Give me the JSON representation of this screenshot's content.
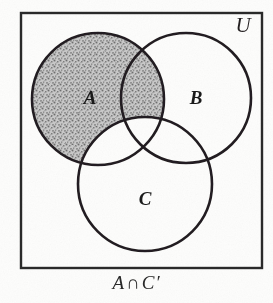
{
  "figure": {
    "caption": "A ∩ C′",
    "caption_set": "A",
    "caption_operator": "∩",
    "caption_complement": "C′",
    "universe_label": "U",
    "set_labels": {
      "a": "A",
      "b": "B",
      "c": "C"
    },
    "shaded_description": "A ∩ C′",
    "colors": {
      "background": "#fdfdfc",
      "ink": "#231f20",
      "shading": "#9a9a9a",
      "border": "#2b2b2b"
    }
  },
  "chart_data": {
    "type": "diagram",
    "diagram_type": "venn",
    "universe": {
      "label": "U",
      "shape": "rectangle",
      "x": 21,
      "y": 13,
      "width": 241,
      "height": 255,
      "label_x": 243,
      "label_y": 32
    },
    "sets": [
      {
        "name": "A",
        "label": "A",
        "cx": 98,
        "cy": 99,
        "r": 66,
        "label_x": 90,
        "label_y": 104,
        "shaded": true
      },
      {
        "name": "B",
        "label": "B",
        "cx": 186,
        "cy": 98,
        "r": 65,
        "label_x": 196,
        "label_y": 104,
        "shaded": false
      },
      {
        "name": "C",
        "label": "C",
        "cx": 145,
        "cy": 184,
        "r": 67,
        "label_x": 145,
        "label_y": 205,
        "shaded": false
      }
    ],
    "shaded_regions": [
      "A only",
      "A ∩ B minus C"
    ],
    "unshaded_regions": [
      "B only",
      "C only",
      "A ∩ C minus B",
      "B ∩ C minus A",
      "A ∩ B ∩ C",
      "outside all sets"
    ],
    "grid": false,
    "legend": false
  }
}
